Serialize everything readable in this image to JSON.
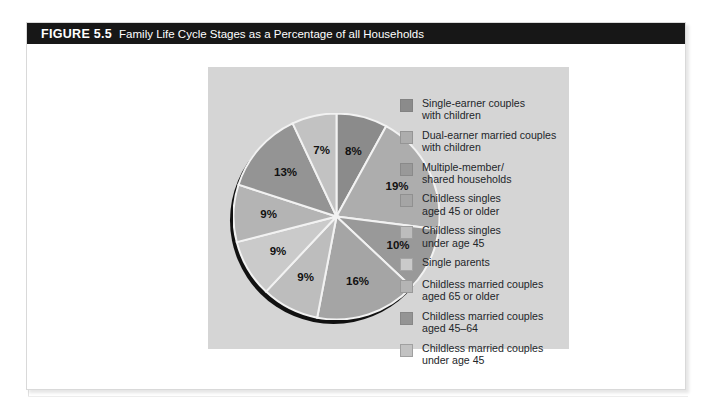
{
  "figure": {
    "label": "FIGURE 5.5",
    "caption": "Family Life Cycle Stages as a Percentage of all Households"
  },
  "chart_data": {
    "type": "pie",
    "title": "Family Life Cycle Stages as a Percentage of all Households",
    "unit": "percent",
    "legend_position": "right",
    "total": 100,
    "categories": [
      "Single-earner couples\nwith children",
      "Dual-earner married couples\nwith children",
      "Multiple-member/\nshared households",
      "Childless singles\naged 45 or older",
      "Childless singles\nunder age 45",
      "Single parents",
      "Childless married couples\naged 65 or older",
      "Childless married couples\naged 45–64",
      "Childless married couples\nunder age 45"
    ],
    "values": [
      8,
      19,
      10,
      16,
      9,
      9,
      9,
      13,
      7
    ],
    "labels": [
      "8%",
      "19%",
      "10%",
      "16%",
      "9%",
      "9%",
      "9%",
      "13%",
      "7%"
    ],
    "colors": [
      "#8b8b8b",
      "#adadad",
      "#999999",
      "#a5a5a5",
      "#bdbdbd",
      "#cacaca",
      "#b4b4b4",
      "#949494",
      "#c2c2c2"
    ]
  },
  "legend": {
    "items": [
      {
        "label": "Single-earner couples\nwith children",
        "color": "#8b8b8b"
      },
      {
        "label": "Dual-earner married couples\nwith children",
        "color": "#adadad"
      },
      {
        "label": "Multiple-member/\nshared households",
        "color": "#999999"
      },
      {
        "label": "Childless singles\naged 45 or older",
        "color": "#a5a5a5"
      },
      {
        "label": "Childless singles\nunder age 45",
        "color": "#bdbdbd"
      },
      {
        "label": "Single parents",
        "color": "#cacaca"
      },
      {
        "label": "Childless married couples\naged 65 or older",
        "color": "#b4b4b4"
      },
      {
        "label": "Childless married couples\naged 45–64",
        "color": "#949494"
      },
      {
        "label": "Childless married couples\nunder age 45",
        "color": "#c2c2c2"
      }
    ]
  }
}
